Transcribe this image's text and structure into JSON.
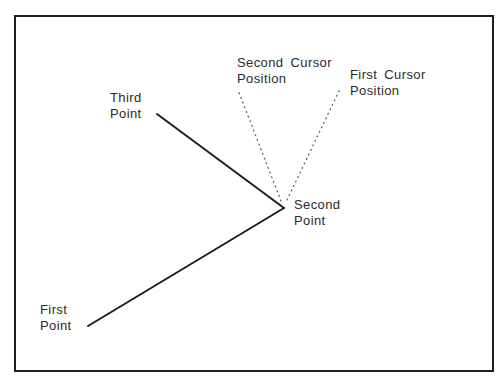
{
  "diagram": {
    "type": "polyline-construction",
    "colors": {
      "frame": "#1e1e1e",
      "line": "#1e1e1e",
      "dotted": "#555555",
      "text": "#2a2a2a",
      "background": "#ffffff"
    },
    "points": {
      "first": {
        "x": 88,
        "y": 326
      },
      "second": {
        "x": 284,
        "y": 208
      },
      "third": {
        "x": 157,
        "y": 114
      }
    },
    "cursor_rays": {
      "first_cursor": {
        "from": {
          "x": 287,
          "y": 200
        },
        "to": {
          "x": 340,
          "y": 89
        }
      },
      "second_cursor": {
        "from": {
          "x": 281,
          "y": 201
        },
        "to": {
          "x": 238,
          "y": 90
        }
      }
    },
    "labels": {
      "third_point": {
        "line1": "Third",
        "line2": "Point"
      },
      "second_point": {
        "line1": "Second",
        "line2": "Point"
      },
      "first_point": {
        "line1": "First",
        "line2": "Point"
      },
      "second_cursor": {
        "line1": "Second Cursor",
        "line2": "Position"
      },
      "first_cursor": {
        "line1": "First Cursor",
        "line2": "Position"
      }
    }
  }
}
